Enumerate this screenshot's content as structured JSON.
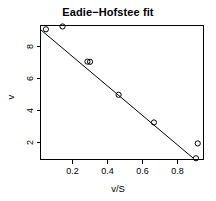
{
  "chart_data": {
    "type": "scatter",
    "title": "Eadie−Hofstee fit",
    "xlabel": "v/S",
    "ylabel": "v",
    "xlim": [
      0.017,
      0.948
    ],
    "ylim": [
      0.875,
      9.0
    ],
    "xticks": [
      0.2,
      0.4,
      0.6,
      0.8
    ],
    "xtick_labels": [
      "0.2",
      "0.4",
      "0.6",
      "0.8"
    ],
    "yticks": [
      2,
      4,
      6,
      8
    ],
    "ytick_labels": [
      "2",
      "4",
      "6",
      "8"
    ],
    "grid": false,
    "legend": null,
    "point_marker": "open-circle",
    "points": [
      {
        "x": 0.048,
        "y": 8.77
      },
      {
        "x": 0.143,
        "y": 8.94
      },
      {
        "x": 0.285,
        "y": 6.81
      },
      {
        "x": 0.3,
        "y": 6.8
      },
      {
        "x": 0.463,
        "y": 4.8
      },
      {
        "x": 0.665,
        "y": 3.12
      },
      {
        "x": 0.915,
        "y": 1.85
      },
      {
        "x": 0.905,
        "y": 0.95
      }
    ],
    "series": [
      {
        "name": "observations",
        "x": [
          0.048,
          0.143,
          0.285,
          0.3,
          0.463,
          0.665,
          0.915,
          0.905
        ],
        "values": [
          8.77,
          8.94,
          6.81,
          6.8,
          4.8,
          3.12,
          1.85,
          0.95
        ]
      },
      {
        "name": "fit-line",
        "type": "line",
        "x": [
          0.022,
          0.888
        ],
        "values": [
          8.92,
          0.97
        ]
      }
    ],
    "fit_line": {
      "x_start": 0.022,
      "y_start": 8.92,
      "x_end": 0.888,
      "y_end": 0.97
    },
    "colors": {
      "axis": "#000000",
      "point": "#000000",
      "line": "#000000",
      "background": "#ffffff"
    }
  }
}
